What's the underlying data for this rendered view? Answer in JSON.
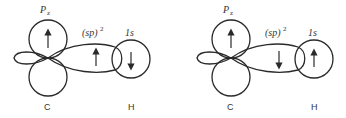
{
  "colors": {
    "stroke": "#2a2a2a",
    "text": "#333333",
    "background": "#ffffff"
  },
  "panels": [
    {
      "id": "left",
      "labels": {
        "pz": "P",
        "pz_sub": "z",
        "sp": "(sp)",
        "sp_sup": "2",
        "one_s": "1s",
        "carbon": "C",
        "hydrogen": "H"
      },
      "spins": {
        "pz": "up",
        "sp": "up",
        "one_s": "down"
      }
    },
    {
      "id": "right",
      "labels": {
        "pz": "P",
        "pz_sub": "z",
        "sp": "(sp)",
        "sp_sup": "2",
        "one_s": "1s",
        "carbon": "C",
        "hydrogen": "H"
      },
      "spins": {
        "pz": "up",
        "sp": "down",
        "one_s": "up"
      }
    }
  ]
}
